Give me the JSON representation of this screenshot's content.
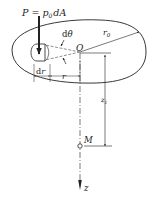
{
  "diagram": {
    "type": "mechanics-figure",
    "labels": {
      "load_P": "P",
      "load_eq": " = ",
      "load_p": "p",
      "load_sub": "0",
      "load_dA": "dA",
      "dtheta_d": "d",
      "dtheta_theta": "θ",
      "origin": "O",
      "radius_r0": "r",
      "radius_r0_sub": "0",
      "dr_d": "d",
      "dr_r": "r",
      "r": "r",
      "depth": "z",
      "depth_sub": "1",
      "point_M": "M",
      "axis_z": "z"
    },
    "colors": {
      "stroke": "#222222",
      "background": "#ffffff"
    }
  }
}
